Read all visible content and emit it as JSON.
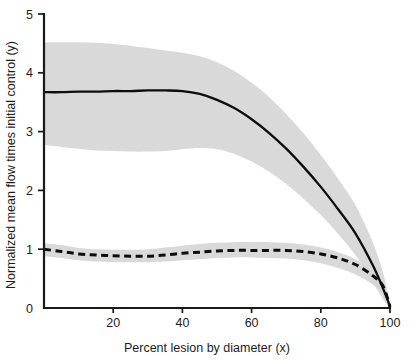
{
  "chart_data": {
    "type": "line",
    "title": "",
    "subtitle": "",
    "xlabel": "Percent lesion by diameter (x)",
    "ylabel": "Normalized mean flow times initial control (y)",
    "xlim": [
      0,
      100
    ],
    "ylim": [
      0,
      5
    ],
    "xticks": [
      20,
      40,
      60,
      80,
      100
    ],
    "xtick_labels": [
      "20",
      "40",
      "60",
      "80",
      "100"
    ],
    "yticks": [
      0,
      1,
      2,
      3,
      4,
      5
    ],
    "ytick_labels": [
      "0",
      "1",
      "2",
      "3",
      "4",
      "5"
    ],
    "grid": false,
    "legend": false,
    "legend_position": "none",
    "band_color": "#d6d6d6",
    "line_color": "#0d0d0d",
    "x": [
      0,
      5,
      10,
      15,
      20,
      25,
      30,
      35,
      40,
      45,
      50,
      55,
      60,
      65,
      70,
      75,
      80,
      85,
      90,
      95,
      98,
      100
    ],
    "series": [
      {
        "name": "Maximal hyperemic flow",
        "style": "solid",
        "values": [
          3.67,
          3.67,
          3.68,
          3.68,
          3.69,
          3.69,
          3.7,
          3.7,
          3.69,
          3.64,
          3.54,
          3.4,
          3.21,
          2.98,
          2.71,
          2.4,
          2.06,
          1.68,
          1.27,
          0.73,
          0.33,
          0.03
        ],
        "band_upper": [
          4.52,
          4.52,
          4.52,
          4.51,
          4.49,
          4.46,
          4.42,
          4.38,
          4.34,
          4.28,
          4.18,
          4.03,
          3.83,
          3.59,
          3.3,
          2.97,
          2.6,
          2.2,
          1.75,
          1.12,
          0.6,
          0.05
        ],
        "band_lower": [
          2.77,
          2.74,
          2.71,
          2.68,
          2.67,
          2.66,
          2.66,
          2.67,
          2.7,
          2.72,
          2.7,
          2.62,
          2.49,
          2.32,
          2.11,
          1.86,
          1.58,
          1.26,
          0.9,
          0.44,
          0.15,
          0.0
        ]
      },
      {
        "name": "Resting flow",
        "style": "dashed",
        "values": [
          1.0,
          0.96,
          0.92,
          0.9,
          0.89,
          0.88,
          0.88,
          0.9,
          0.93,
          0.95,
          0.97,
          0.98,
          0.98,
          0.98,
          0.98,
          0.96,
          0.92,
          0.85,
          0.74,
          0.55,
          0.37,
          0.02
        ],
        "band_upper": [
          1.1,
          1.07,
          1.02,
          1.0,
          0.99,
          0.99,
          1.0,
          1.03,
          1.06,
          1.09,
          1.11,
          1.12,
          1.12,
          1.12,
          1.11,
          1.08,
          1.03,
          0.95,
          0.83,
          0.62,
          0.43,
          0.05
        ],
        "band_lower": [
          0.88,
          0.85,
          0.81,
          0.79,
          0.78,
          0.78,
          0.78,
          0.79,
          0.81,
          0.83,
          0.85,
          0.86,
          0.86,
          0.85,
          0.84,
          0.81,
          0.76,
          0.68,
          0.57,
          0.4,
          0.24,
          0.0
        ]
      }
    ]
  }
}
